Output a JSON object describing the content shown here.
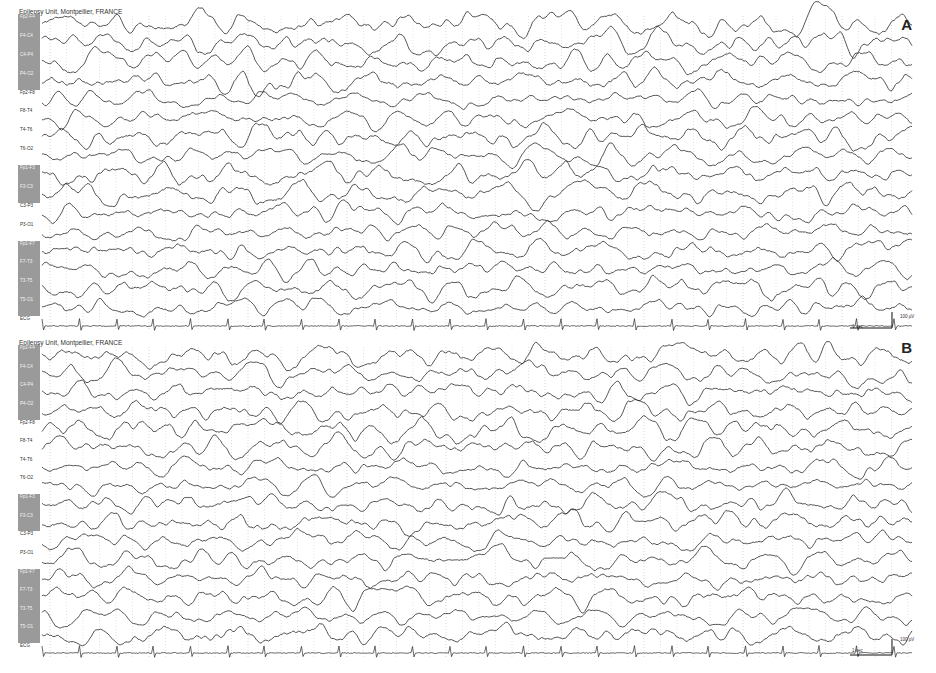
{
  "chart_data": [
    {
      "type": "line",
      "panel": "A",
      "title": "Epilepsy Unit, Montpellier, FRANCE",
      "xlabel": "",
      "ylabel": "",
      "channels": [
        "Fp2-F4",
        "F4-C4",
        "C4-P4",
        "P4-O2",
        "Fp2-F8",
        "F8-T4",
        "T4-T6",
        "T6-O2",
        "Fp1-F3",
        "F3-C3",
        "C3-P3",
        "P3-O1",
        "Fp1-F7",
        "F7-T3",
        "T3-T5",
        "T5-O1",
        "ECG"
      ],
      "shaded_channels": [
        "Fp2-F4",
        "F4-C4",
        "C4-P4",
        "P4-O2",
        "Fp1-F3",
        "F3-C3",
        "Fp1-F7",
        "F7-T3",
        "T3-T5",
        "T5-O1"
      ],
      "scale": {
        "time": "1 sec",
        "amplitude": "100 µV"
      },
      "grid": "vertical dotted, 1 s major",
      "annotations": [
        "A"
      ]
    },
    {
      "type": "line",
      "panel": "B",
      "title": "Epilepsy Unit, Montpellier, FRANCE",
      "xlabel": "",
      "ylabel": "",
      "channels": [
        "Fp2-F4",
        "F4-C4",
        "C4-P4",
        "P4-O2",
        "Fp2-F8",
        "F8-T4",
        "T4-T6",
        "T6-O2",
        "Fp1-F3",
        "F3-C3",
        "C3-P3",
        "P3-O1",
        "Fp1-F7",
        "F7-T3",
        "T3-T5",
        "T5-O1",
        "ECG"
      ],
      "shaded_channels": [
        "Fp2-F4",
        "F4-C4",
        "C4-P4",
        "P4-O2",
        "Fp1-F3",
        "F3-C3",
        "Fp1-F7",
        "F7-T3",
        "T3-T5",
        "T5-O1"
      ],
      "scale": {
        "time": "1 sec",
        "amplitude": "100 µV"
      },
      "grid": "vertical dotted, 1 s major",
      "annotations": [
        "B"
      ]
    }
  ],
  "panels": {
    "a": {
      "title": "Epilepsy Unit, Montpellier, FRANCE",
      "letter": "A",
      "time_scale": "1 sec",
      "amp_scale": "100 µV"
    },
    "b": {
      "title": "Epilepsy Unit, Montpellier, FRANCE",
      "letter": "B",
      "time_scale": "1 sec",
      "amp_scale": "100 µV"
    }
  },
  "channels": [
    {
      "label": "Fp2-F4",
      "shaded": true
    },
    {
      "label": "F4-C4",
      "shaded": true
    },
    {
      "label": "C4-P4",
      "shaded": true
    },
    {
      "label": "P4-O2",
      "shaded": true
    },
    {
      "label": "Fp2-F8",
      "shaded": false
    },
    {
      "label": "F8-T4",
      "shaded": false
    },
    {
      "label": "T4-T6",
      "shaded": false
    },
    {
      "label": "T6-O2",
      "shaded": false
    },
    {
      "label": "Fp1-F3",
      "shaded": true
    },
    {
      "label": "F3-C3",
      "shaded": true
    },
    {
      "label": "C3-P3",
      "shaded": false
    },
    {
      "label": "P3-O1",
      "shaded": false
    },
    {
      "label": "Fp1-F7",
      "shaded": true
    },
    {
      "label": "F7-T3",
      "shaded": true
    },
    {
      "label": "T3-T5",
      "shaded": true
    },
    {
      "label": "T5-O1",
      "shaded": true
    },
    {
      "label": "ECG",
      "shaded": false
    }
  ],
  "colors": {
    "trace": "#2a2a2a",
    "grid": "#b8b8b8",
    "shade": "#9a9a9a",
    "background": "#ffffff"
  }
}
